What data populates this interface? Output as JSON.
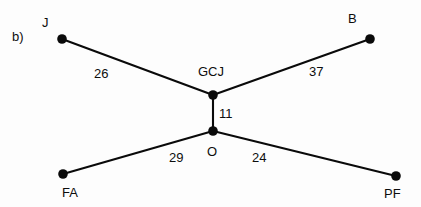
{
  "figure": {
    "panel_label": "b)",
    "background_color": "#fdfdfd",
    "ink_color": "#0a0a0a"
  },
  "chart_data": {
    "type": "diagram",
    "subtype": "weighted-undirected-graph",
    "title": "",
    "xlabel": "",
    "ylabel": "",
    "grid": false,
    "legend": "none",
    "nodes": [
      {
        "id": "J",
        "label": "J",
        "x": 62,
        "y": 39,
        "label_x": 42,
        "label_y": 16,
        "label_pos": "above-left"
      },
      {
        "id": "B",
        "label": "B",
        "x": 370,
        "y": 39,
        "label_x": 348,
        "label_y": 12,
        "label_pos": "above-left"
      },
      {
        "id": "GCJ",
        "label": "GCJ",
        "x": 213,
        "y": 95,
        "label_x": 198,
        "label_y": 65,
        "label_pos": "above"
      },
      {
        "id": "O",
        "label": "O",
        "x": 213,
        "y": 131,
        "label_x": 207,
        "label_y": 145,
        "label_pos": "below"
      },
      {
        "id": "FA",
        "label": "FA",
        "x": 63,
        "y": 174,
        "label_x": 62,
        "label_y": 186,
        "label_pos": "below"
      },
      {
        "id": "PF",
        "label": "PF",
        "x": 396,
        "y": 176,
        "label_x": 384,
        "label_y": 187,
        "label_pos": "below"
      }
    ],
    "edges": [
      {
        "source": "J",
        "target": "GCJ",
        "weight": 26,
        "label": "26",
        "label_x": 94,
        "label_y": 67
      },
      {
        "source": "GCJ",
        "target": "B",
        "weight": 37,
        "label": "37",
        "label_x": 309,
        "label_y": 65
      },
      {
        "source": "GCJ",
        "target": "O",
        "weight": 11,
        "label": "11",
        "label_x": 219,
        "label_y": 107
      },
      {
        "source": "FA",
        "target": "O",
        "weight": 29,
        "label": "29",
        "label_x": 169,
        "label_y": 151
      },
      {
        "source": "O",
        "target": "PF",
        "weight": 24,
        "label": "24",
        "label_x": 252,
        "label_y": 151
      }
    ],
    "node_radius": 4.8,
    "edge_stroke_width": 2.1,
    "panel_label": "b)",
    "panel_label_x": 12,
    "panel_label_y": 30
  }
}
